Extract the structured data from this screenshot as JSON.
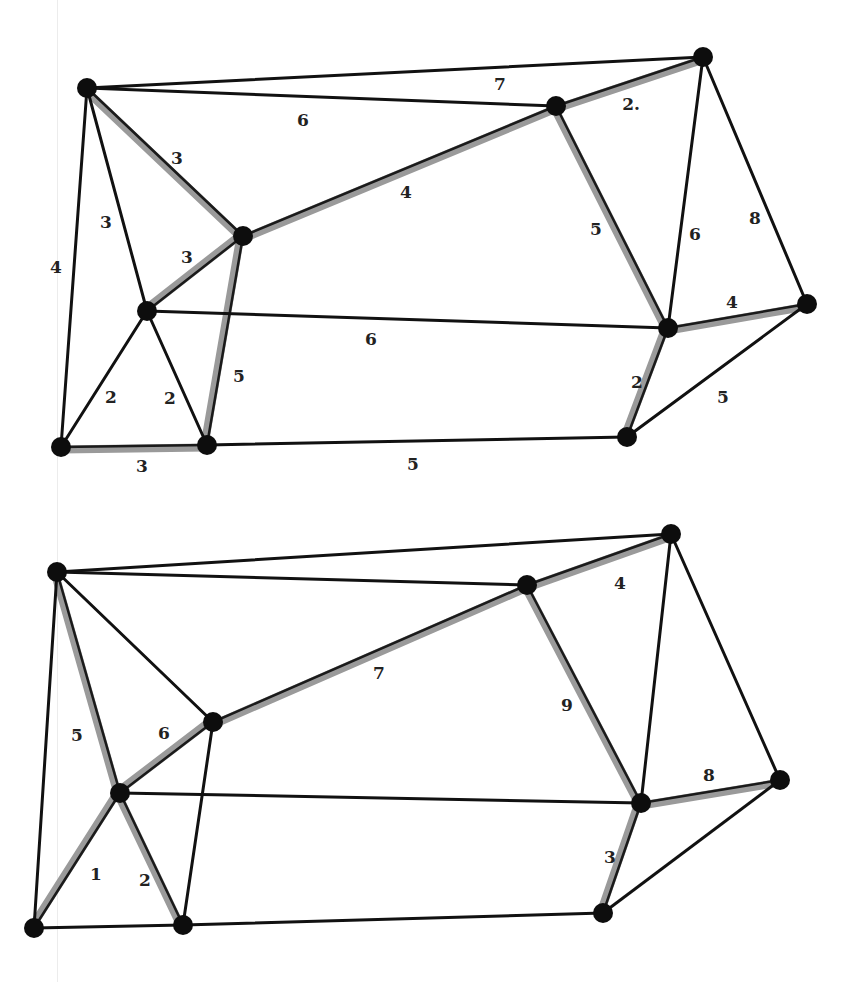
{
  "diagrams": [
    {
      "name": "top-graph",
      "nodes": [
        {
          "id": "A",
          "x": 87,
          "y": 88
        },
        {
          "id": "B",
          "x": 243,
          "y": 236
        },
        {
          "id": "C",
          "x": 147,
          "y": 311
        },
        {
          "id": "D",
          "x": 61,
          "y": 447
        },
        {
          "id": "E",
          "x": 207,
          "y": 445
        },
        {
          "id": "F",
          "x": 556,
          "y": 106
        },
        {
          "id": "G",
          "x": 703,
          "y": 57
        },
        {
          "id": "H",
          "x": 668,
          "y": 328
        },
        {
          "id": "I",
          "x": 807,
          "y": 304
        },
        {
          "id": "J",
          "x": 627,
          "y": 437
        }
      ],
      "edges": [
        {
          "from": "A",
          "to": "G",
          "weight": "7",
          "highlight": false,
          "lx": 500,
          "ly": 85
        },
        {
          "from": "A",
          "to": "F",
          "weight": "6",
          "highlight": false,
          "lx": 303,
          "ly": 121
        },
        {
          "from": "A",
          "to": "B",
          "weight": "3",
          "highlight": true,
          "lx": 177,
          "ly": 159
        },
        {
          "from": "A",
          "to": "C",
          "weight": "3",
          "highlight": false,
          "lx": 106,
          "ly": 223
        },
        {
          "from": "A",
          "to": "D",
          "weight": "4",
          "highlight": false,
          "lx": 56,
          "ly": 268
        },
        {
          "from": "B",
          "to": "F",
          "weight": "4",
          "highlight": true,
          "lx": 406,
          "ly": 193
        },
        {
          "from": "B",
          "to": "C",
          "weight": "3",
          "highlight": true,
          "lx": 187,
          "ly": 258
        },
        {
          "from": "B",
          "to": "E",
          "weight": "5",
          "highlight": true,
          "lx": 239,
          "ly": 377
        },
        {
          "from": "C",
          "to": "D",
          "weight": "2",
          "highlight": false,
          "lx": 111,
          "ly": 398
        },
        {
          "from": "C",
          "to": "E",
          "weight": "2",
          "highlight": false,
          "lx": 170,
          "ly": 399
        },
        {
          "from": "C",
          "to": "H",
          "weight": "6",
          "highlight": false,
          "lx": 371,
          "ly": 340
        },
        {
          "from": "D",
          "to": "E",
          "weight": "3",
          "highlight": true,
          "lx": 142,
          "ly": 467
        },
        {
          "from": "E",
          "to": "J",
          "weight": "5",
          "highlight": false,
          "lx": 413,
          "ly": 465
        },
        {
          "from": "F",
          "to": "G",
          "weight": "2.",
          "highlight": true,
          "lx": 631,
          "ly": 105
        },
        {
          "from": "F",
          "to": "H",
          "weight": "5",
          "highlight": true,
          "lx": 596,
          "ly": 230
        },
        {
          "from": "G",
          "to": "H",
          "weight": "6",
          "highlight": false,
          "lx": 695,
          "ly": 235
        },
        {
          "from": "G",
          "to": "I",
          "weight": "8",
          "highlight": false,
          "lx": 755,
          "ly": 219
        },
        {
          "from": "H",
          "to": "I",
          "weight": "4",
          "highlight": true,
          "lx": 732,
          "ly": 303
        },
        {
          "from": "H",
          "to": "J",
          "weight": "2",
          "highlight": true,
          "lx": 637,
          "ly": 383
        },
        {
          "from": "I",
          "to": "J",
          "weight": "5",
          "highlight": false,
          "lx": 723,
          "ly": 398
        }
      ]
    },
    {
      "name": "bottom-graph",
      "nodes": [
        {
          "id": "A",
          "x": 57,
          "y": 572
        },
        {
          "id": "B",
          "x": 213,
          "y": 722
        },
        {
          "id": "C",
          "x": 120,
          "y": 793
        },
        {
          "id": "D",
          "x": 34,
          "y": 928
        },
        {
          "id": "E",
          "x": 183,
          "y": 925
        },
        {
          "id": "F",
          "x": 527,
          "y": 585
        },
        {
          "id": "G",
          "x": 671,
          "y": 534
        },
        {
          "id": "H",
          "x": 641,
          "y": 803
        },
        {
          "id": "I",
          "x": 780,
          "y": 780
        },
        {
          "id": "J",
          "x": 603,
          "y": 913
        }
      ],
      "edges": [
        {
          "from": "A",
          "to": "G",
          "weight": "",
          "highlight": false,
          "lx": 0,
          "ly": 0
        },
        {
          "from": "A",
          "to": "F",
          "weight": "",
          "highlight": false,
          "lx": 0,
          "ly": 0
        },
        {
          "from": "A",
          "to": "B",
          "weight": "",
          "highlight": false,
          "lx": 0,
          "ly": 0
        },
        {
          "from": "A",
          "to": "C",
          "weight": "5",
          "highlight": true,
          "lx": 77,
          "ly": 736
        },
        {
          "from": "A",
          "to": "D",
          "weight": "",
          "highlight": false,
          "lx": 0,
          "ly": 0
        },
        {
          "from": "B",
          "to": "F",
          "weight": "7",
          "highlight": true,
          "lx": 379,
          "ly": 674
        },
        {
          "from": "B",
          "to": "C",
          "weight": "6",
          "highlight": true,
          "lx": 164,
          "ly": 734
        },
        {
          "from": "B",
          "to": "E",
          "weight": "",
          "highlight": false,
          "lx": 0,
          "ly": 0
        },
        {
          "from": "C",
          "to": "D",
          "weight": "1",
          "highlight": true,
          "lx": 96,
          "ly": 875
        },
        {
          "from": "C",
          "to": "E",
          "weight": "2",
          "highlight": true,
          "lx": 145,
          "ly": 881
        },
        {
          "from": "C",
          "to": "H",
          "weight": "",
          "highlight": false,
          "lx": 0,
          "ly": 0
        },
        {
          "from": "D",
          "to": "E",
          "weight": "",
          "highlight": false,
          "lx": 0,
          "ly": 0
        },
        {
          "from": "E",
          "to": "J",
          "weight": "",
          "highlight": false,
          "lx": 0,
          "ly": 0
        },
        {
          "from": "F",
          "to": "G",
          "weight": "4",
          "highlight": true,
          "lx": 620,
          "ly": 584
        },
        {
          "from": "F",
          "to": "H",
          "weight": "9",
          "highlight": true,
          "lx": 567,
          "ly": 706
        },
        {
          "from": "G",
          "to": "H",
          "weight": "",
          "highlight": false,
          "lx": 0,
          "ly": 0
        },
        {
          "from": "G",
          "to": "I",
          "weight": "",
          "highlight": false,
          "lx": 0,
          "ly": 0
        },
        {
          "from": "H",
          "to": "I",
          "weight": "8",
          "highlight": true,
          "lx": 709,
          "ly": 776
        },
        {
          "from": "H",
          "to": "J",
          "weight": "3",
          "highlight": true,
          "lx": 610,
          "ly": 858
        },
        {
          "from": "I",
          "to": "J",
          "weight": "",
          "highlight": false,
          "lx": 0,
          "ly": 0
        }
      ]
    }
  ]
}
